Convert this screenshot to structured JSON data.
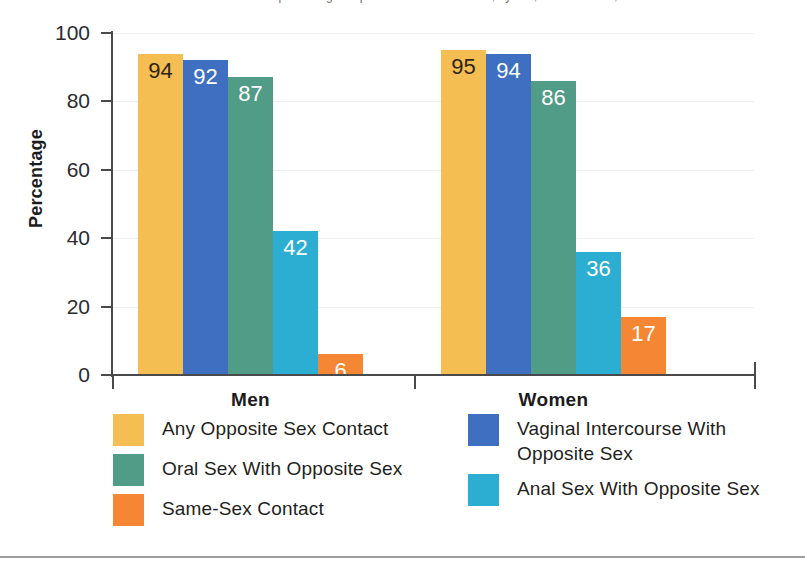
{
  "figure": {
    "cropped_caption": "the percentages reported for each behavior, by sex, United States, 2006",
    "bottom_rule": true
  },
  "chart_data": {
    "type": "bar",
    "title": "",
    "xlabel": "",
    "ylabel": "Percentage",
    "ylim": [
      0,
      100
    ],
    "yticks": [
      0,
      20,
      40,
      60,
      80,
      100
    ],
    "grid": true,
    "legend_position": "bottom",
    "categories": [
      "Men",
      "Women"
    ],
    "series": [
      {
        "name": "Any Opposite Sex Contact",
        "color": "#f5be52",
        "label_color": "dark",
        "values": [
          94,
          95
        ]
      },
      {
        "name": "Vaginal Intercourse With Opposite Sex",
        "color": "#3e6fc0",
        "label_color": "light",
        "values": [
          92,
          94
        ]
      },
      {
        "name": "Oral Sex With Opposite Sex",
        "color": "#519c86",
        "label_color": "light",
        "values": [
          87,
          86
        ]
      },
      {
        "name": "Anal Sex With Opposite Sex",
        "color": "#2baed2",
        "label_color": "light",
        "values": [
          42,
          36
        ]
      },
      {
        "name": "Same-Sex Contact",
        "color": "#f58634",
        "label_color": "light",
        "values": [
          6,
          17
        ]
      }
    ]
  },
  "legend": {
    "left_column": [
      {
        "label": "Any Opposite Sex Contact",
        "color": "#f5be52"
      },
      {
        "label": "Oral Sex With Opposite Sex",
        "color": "#519c86"
      },
      {
        "label": "Same-Sex Contact",
        "color": "#f58634"
      }
    ],
    "right_column": [
      {
        "label": "Vaginal Intercourse With Opposite Sex",
        "color": "#3e6fc0"
      },
      {
        "label": "Anal Sex With Opposite Sex",
        "color": "#2baed2"
      }
    ]
  },
  "axis": {
    "y_title": "Percentage",
    "tick_labels": [
      "100",
      "80",
      "60",
      "40",
      "20",
      "0"
    ],
    "group_labels": [
      "Men",
      "Women"
    ]
  },
  "colors": {
    "gold": "#f5be52",
    "blue": "#3e6fc0",
    "teal": "#519c86",
    "cyan": "#2baed2",
    "orange": "#f58634",
    "axis": "#4a4a4c",
    "gridline": "#f0eff2",
    "text": "#1f1f21"
  }
}
